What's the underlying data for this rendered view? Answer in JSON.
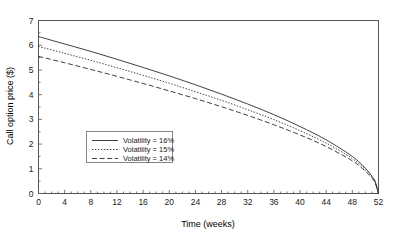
{
  "chart_data": {
    "type": "line",
    "title": "",
    "xlabel": "Time (weeks)",
    "ylabel": "Call option price ($)",
    "xlim": [
      0,
      52
    ],
    "ylim": [
      0,
      7
    ],
    "xticks": [
      0,
      4,
      8,
      12,
      16,
      20,
      24,
      28,
      32,
      36,
      40,
      44,
      48,
      52
    ],
    "xtick_labels": [
      "0",
      "4",
      "8",
      "12",
      "16",
      "20",
      "24",
      "28",
      "32",
      "36",
      "40",
      "44",
      "48",
      "52"
    ],
    "yticks": [
      0,
      1,
      2,
      3,
      4,
      5,
      6,
      7
    ],
    "ytick_labels": [
      "0",
      "1",
      "2",
      "3",
      "4",
      "5",
      "6",
      "7"
    ],
    "grid": false,
    "minor_ticks": true,
    "legend_position": "center-left",
    "x": [
      0,
      4,
      8,
      12,
      16,
      20,
      24,
      28,
      32,
      36,
      40,
      44,
      48,
      50,
      51,
      51.5,
      52
    ],
    "series": [
      {
        "name": "Volatility = 16%",
        "label": "Volatility = 16%",
        "linestyle": "solid",
        "color": "#2b2b2b",
        "values": [
          6.35,
          6.05,
          5.75,
          5.43,
          5.1,
          4.76,
          4.4,
          4.02,
          3.62,
          3.19,
          2.71,
          2.17,
          1.5,
          1.02,
          0.7,
          0.48,
          0.0
        ]
      },
      {
        "name": "Volatility = 15%",
        "label": "Volatility = 15%",
        "linestyle": "dotted",
        "color": "#2b2b2b",
        "values": [
          5.95,
          5.67,
          5.39,
          5.09,
          4.78,
          4.46,
          4.12,
          3.77,
          3.39,
          2.99,
          2.54,
          2.04,
          1.41,
          0.96,
          0.66,
          0.45,
          0.0
        ]
      },
      {
        "name": "Volatility = 14%",
        "label": "Volatility = 14%",
        "linestyle": "dashed",
        "color": "#2b2b2b",
        "values": [
          5.55,
          5.29,
          5.02,
          4.74,
          4.45,
          4.15,
          3.84,
          3.51,
          3.16,
          2.78,
          2.37,
          1.9,
          1.32,
          0.9,
          0.62,
          0.42,
          0.0
        ]
      }
    ]
  },
  "axes": {
    "x_title": "Time (weeks)",
    "y_title": "Call option price ($)"
  },
  "legend": {
    "entries": [
      {
        "label": "Volatility = 16%",
        "style": "solid"
      },
      {
        "label": "Volatility = 15%",
        "style": "dotted"
      },
      {
        "label": "Volatility = 14%",
        "style": "dashed"
      }
    ]
  }
}
